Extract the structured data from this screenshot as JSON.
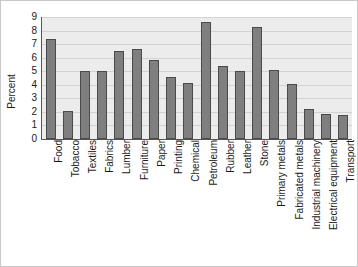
{
  "chart_data": {
    "type": "bar",
    "title": "",
    "xlabel": "",
    "ylabel": "Percent",
    "ylim": [
      0,
      9
    ],
    "ytick_labels": [
      "9",
      "8",
      "7",
      "6",
      "5",
      "4",
      "3",
      "2",
      "1",
      "0"
    ],
    "yticks": [
      9,
      8,
      7,
      6,
      5,
      4,
      3,
      2,
      1,
      0
    ],
    "grid": true,
    "legend": "none",
    "categories": [
      "Food",
      "Tobacco",
      "Textiles",
      "Fabrics",
      "Lumber",
      "Furniture",
      "Paper",
      "Printing",
      "Chemical",
      "Petroleum",
      "Rubber",
      "Leather",
      "Stone",
      "Primary metals",
      "Fabricated metals",
      "Industrial machinery",
      "Electrical equipment",
      "Transport"
    ],
    "values": [
      7.4,
      2.1,
      5.0,
      5.0,
      6.5,
      6.65,
      5.85,
      4.6,
      4.15,
      8.6,
      5.4,
      5.0,
      8.3,
      5.1,
      4.05,
      2.2,
      1.85,
      1.8
    ],
    "colors": {
      "bar_fill": "#807f80",
      "bar_edge": "#4a4a4a",
      "plot_background": "#ececed",
      "gridline": "#d2d2d3",
      "axis": "#555555",
      "text": "#1a1a1a",
      "frame": "#c8c8c8"
    }
  }
}
